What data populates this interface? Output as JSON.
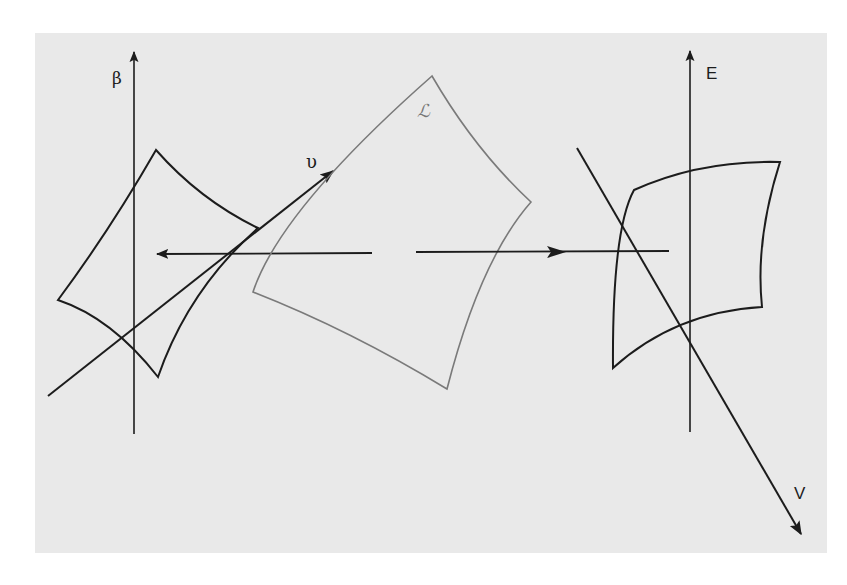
{
  "diagram": {
    "background_color": "#e9e9e9",
    "stroke_color": "#1c1c1c",
    "manifold_color": "#7a7a7a",
    "left_panel": {
      "axis_label": "β",
      "vector_label": "υ"
    },
    "center": {
      "manifold_label": "ℒ"
    },
    "right_panel": {
      "axis_label": "E",
      "vector_label": "V"
    }
  }
}
